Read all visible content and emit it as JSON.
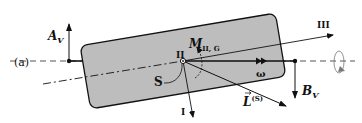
{
  "figure": {
    "panel_label": "(a)",
    "labels": {
      "A_v": {
        "main": "A",
        "sub": "V"
      },
      "B_v": {
        "main": "B",
        "sub": "V"
      },
      "M": {
        "main": "M",
        "sub": "II, G"
      },
      "L": {
        "main": "L",
        "sup": "(S)"
      },
      "omega": "ω",
      "S": "S",
      "axis_I": "I",
      "axis_II": "II",
      "axis_III": "III"
    },
    "colors": {
      "body_fill": "#bdbdbd",
      "stroke": "#111111",
      "axis_dash": "#555555"
    }
  }
}
